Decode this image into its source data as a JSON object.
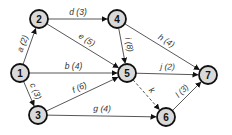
{
  "diagram": {
    "type": "directed-network",
    "nodes": [
      {
        "id": "1",
        "label": "1",
        "x": 20,
        "y": 73
      },
      {
        "id": "2",
        "label": "2",
        "x": 39,
        "y": 19
      },
      {
        "id": "3",
        "label": "3",
        "x": 38,
        "y": 115
      },
      {
        "id": "4",
        "label": "4",
        "x": 117,
        "y": 19
      },
      {
        "id": "5",
        "label": "5",
        "x": 127,
        "y": 73
      },
      {
        "id": "6",
        "label": "6",
        "x": 166,
        "y": 117
      },
      {
        "id": "7",
        "label": "7",
        "x": 208,
        "y": 75
      }
    ],
    "edges": [
      {
        "id": "a",
        "from": "1",
        "to": "2",
        "label": "a (2)",
        "dashed": false
      },
      {
        "id": "b",
        "from": "1",
        "to": "5",
        "label": "b (4)",
        "dashed": false
      },
      {
        "id": "c",
        "from": "1",
        "to": "3",
        "label": "c (3)",
        "dashed": false
      },
      {
        "id": "d",
        "from": "2",
        "to": "4",
        "label": "d (3)",
        "dashed": false
      },
      {
        "id": "e",
        "from": "2",
        "to": "5",
        "label": "e (5)",
        "dashed": false
      },
      {
        "id": "f",
        "from": "3",
        "to": "5",
        "label": "f (6)",
        "dashed": false
      },
      {
        "id": "g",
        "from": "3",
        "to": "6",
        "label": "g (4)",
        "dashed": false
      },
      {
        "id": "h",
        "from": "4",
        "to": "7",
        "label": "h (4)",
        "dashed": false
      },
      {
        "id": "i",
        "from": "4",
        "to": "5",
        "label": "i (8)",
        "dashed": false
      },
      {
        "id": "j",
        "from": "5",
        "to": "7",
        "label": "j (2)",
        "dashed": false
      },
      {
        "id": "k",
        "from": "5",
        "to": "6",
        "label": "k",
        "dashed": true
      },
      {
        "id": "l",
        "from": "6",
        "to": "7",
        "label": "l (3)",
        "dashed": false
      }
    ]
  }
}
